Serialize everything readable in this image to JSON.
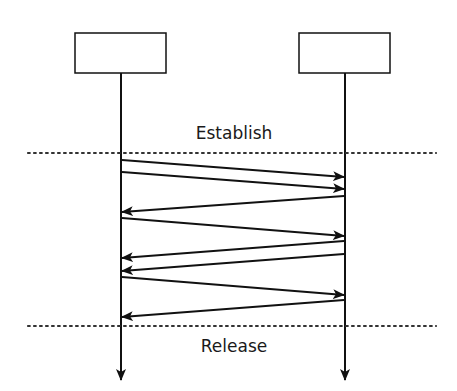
{
  "diagram": {
    "type": "sequence",
    "participants": [
      {
        "id": "left",
        "label": "",
        "x": 121,
        "box": {
          "x": 75,
          "y": 33,
          "w": 91,
          "h": 40
        }
      },
      {
        "id": "right",
        "label": "",
        "x": 345,
        "box": {
          "x": 299,
          "y": 33,
          "w": 91,
          "h": 40
        }
      }
    ],
    "lifeline": {
      "top": 73,
      "bottom": 380
    },
    "phases": [
      {
        "label": "Establish",
        "line_y": 153,
        "label_y": 139
      },
      {
        "label": "Release",
        "line_y": 326,
        "label_y": 352
      }
    ],
    "messages": [
      {
        "from": "left",
        "to": "right",
        "y1": 160,
        "y2": 177
      },
      {
        "from": "left",
        "to": "right",
        "y1": 172,
        "y2": 189
      },
      {
        "from": "right",
        "to": "left",
        "y1": 196,
        "y2": 212
      },
      {
        "from": "left",
        "to": "right",
        "y1": 218,
        "y2": 236
      },
      {
        "from": "right",
        "to": "left",
        "y1": 241,
        "y2": 258
      },
      {
        "from": "right",
        "to": "left",
        "y1": 254,
        "y2": 271
      },
      {
        "from": "left",
        "to": "right",
        "y1": 277,
        "y2": 295
      },
      {
        "from": "right",
        "to": "left",
        "y1": 300,
        "y2": 317
      }
    ],
    "colors": {
      "line": "#111111",
      "box_fill": "#ffffff",
      "dotted": "#333333"
    }
  }
}
